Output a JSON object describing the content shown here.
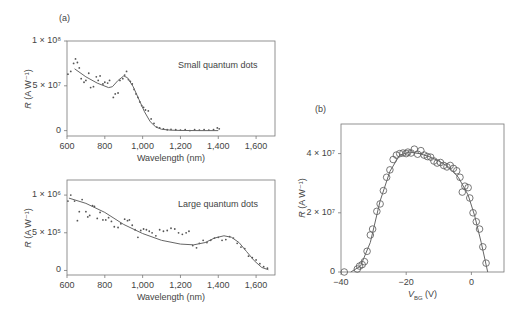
{
  "panels": {
    "a_label": "(a)",
    "b_label": "(b)"
  },
  "chart_data": [
    {
      "id": "small_qd",
      "type": "scatter",
      "panel": "(a)",
      "annotation": "Small quantum dots",
      "xlabel": "Wavelength (nm)",
      "ylabel": "R (A W⁻¹)",
      "xlim": [
        600,
        1700
      ],
      "ylim": [
        -6000000.0,
        100000000.0
      ],
      "xticks": [
        600,
        800,
        1000,
        1200,
        1400,
        1600
      ],
      "xtick_labels": [
        "600",
        "800",
        "1,000",
        "1,200",
        "1,400",
        "1,600"
      ],
      "yticks": [
        0,
        50000000.0,
        100000000.0
      ],
      "ytick_labels": [
        "0",
        "5 × 10⁷",
        "1 × 10⁸"
      ],
      "series": [
        {
          "name": "measured",
          "style": "dots",
          "x": [
            605,
            620,
            635,
            645,
            655,
            665,
            675,
            690,
            700,
            715,
            725,
            740,
            755,
            765,
            775,
            790,
            800,
            815,
            825,
            845,
            855,
            870,
            880,
            895,
            905,
            915,
            925,
            935,
            945,
            955,
            965,
            975,
            985,
            995,
            1005,
            1015,
            1030,
            1045,
            1060,
            1075,
            1090,
            1110,
            1130,
            1150,
            1175,
            1200,
            1225,
            1250,
            1275,
            1300,
            1325,
            1350,
            1375,
            1395,
            1405
          ],
          "y": [
            63000000.0,
            66000000.0,
            75000000.0,
            80000000.0,
            76000000.0,
            70000000.0,
            58000000.0,
            54000000.0,
            56000000.0,
            64000000.0,
            48000000.0,
            49000000.0,
            60000000.0,
            56000000.0,
            61000000.0,
            52000000.0,
            54000000.0,
            53000000.0,
            56000000.0,
            37000000.0,
            41000000.0,
            42000000.0,
            56000000.0,
            58000000.0,
            62000000.0,
            66000000.0,
            57000000.0,
            55000000.0,
            52000000.0,
            46000000.0,
            41000000.0,
            37000000.0,
            32000000.0,
            28000000.0,
            26000000.0,
            23000000.0,
            22000000.0,
            13000000.0,
            8000000.0,
            4000000.0,
            3000000.0,
            2000000.0,
            1000000.0,
            1500000.0,
            1000000.0,
            500000.0,
            1000000.0,
            0.0,
            1000000.0,
            500000.0,
            1000000.0,
            500000.0,
            1000000.0,
            3000000.0,
            2000000.0
          ]
        },
        {
          "name": "fit",
          "style": "line",
          "x": [
            640,
            700,
            760,
            820,
            840,
            870,
            900,
            920,
            950,
            980,
            1010,
            1040,
            1070,
            1100,
            1150,
            1200,
            1300,
            1400
          ],
          "y": [
            69000000.0,
            60000000.0,
            53000000.0,
            48000000.0,
            49000000.0,
            56000000.0,
            61000000.0,
            59000000.0,
            49000000.0,
            35000000.0,
            21000000.0,
            10000000.0,
            4000000.0,
            1500000.0,
            500000.0,
            200000.0,
            0.0,
            0.0
          ]
        }
      ]
    },
    {
      "id": "large_qd",
      "type": "scatter",
      "panel": "(a)",
      "annotation": "Large quantum dots",
      "xlabel": "Wavelength (nm)",
      "ylabel": "R (A W⁻¹)",
      "xlim": [
        600,
        1700
      ],
      "ylim": [
        -60000.0,
        1200000.0
      ],
      "xticks": [
        600,
        800,
        1000,
        1200,
        1400,
        1600
      ],
      "xtick_labels": [
        "600",
        "800",
        "1,000",
        "1,200",
        "1,400",
        "1,600"
      ],
      "yticks": [
        0,
        500000.0,
        1000000.0
      ],
      "ytick_labels": [
        "0",
        "5 × 10⁵",
        "1 × 10⁶"
      ],
      "series": [
        {
          "name": "measured",
          "style": "dots",
          "x": [
            605,
            620,
            640,
            655,
            665,
            680,
            700,
            710,
            720,
            735,
            745,
            760,
            775,
            790,
            805,
            820,
            835,
            850,
            870,
            885,
            905,
            920,
            930,
            945,
            960,
            975,
            990,
            1005,
            1020,
            1035,
            1050,
            1070,
            1090,
            1110,
            1130,
            1150,
            1170,
            1190,
            1210,
            1230,
            1245,
            1265,
            1285,
            1300,
            1320,
            1340,
            1360,
            1380,
            1400,
            1420,
            1440,
            1460,
            1480,
            1500,
            1520,
            1540,
            1560,
            1580,
            1600,
            1620,
            1640,
            1660
          ],
          "y": [
            920000.0,
            1000000.0,
            920000.0,
            660000.0,
            780000.0,
            940000.0,
            780000.0,
            710000.0,
            730000.0,
            860000.0,
            850000.0,
            690000.0,
            770000.0,
            670000.0,
            670000.0,
            700000.0,
            650000.0,
            580000.0,
            570000.0,
            620000.0,
            680000.0,
            660000.0,
            670000.0,
            600000.0,
            540000.0,
            440000.0,
            530000.0,
            550000.0,
            540000.0,
            520000.0,
            500000.0,
            460000.0,
            540000.0,
            520000.0,
            530000.0,
            560000.0,
            550000.0,
            500000.0,
            480000.0,
            500000.0,
            520000.0,
            330000.0,
            300000.0,
            360000.0,
            400000.0,
            370000.0,
            400000.0,
            430000.0,
            440000.0,
            400000.0,
            410000.0,
            450000.0,
            430000.0,
            360000.0,
            310000.0,
            290000.0,
            190000.0,
            170000.0,
            140000.0,
            90000.0,
            50000.0,
            30000.0
          ]
        },
        {
          "name": "fit",
          "style": "line",
          "x": [
            610,
            700,
            800,
            900,
            1000,
            1100,
            1200,
            1270,
            1330,
            1380,
            1430,
            1470,
            1510,
            1550,
            1590,
            1630,
            1665
          ],
          "y": [
            960000.0,
            890000.0,
            770000.0,
            610000.0,
            490000.0,
            400000.0,
            350000.0,
            340000.0,
            370000.0,
            430000.0,
            460000.0,
            440000.0,
            370000.0,
            250000.0,
            130000.0,
            40000.0,
            10000.0
          ]
        }
      ]
    },
    {
      "id": "vbg",
      "type": "scatter",
      "panel": "(b)",
      "xlabel": "V_BG (V)",
      "ylabel": "R (A W⁻¹)",
      "xlim": [
        -40,
        10
      ],
      "ylim": [
        0,
        50000000.0
      ],
      "xticks": [
        -40,
        -20,
        0
      ],
      "xtick_labels": [
        "−40",
        "−20",
        "0"
      ],
      "yticks": [
        0,
        20000000.0,
        40000000.0
      ],
      "ytick_labels": [
        "0",
        "2 × 10⁷",
        "4 × 10⁷"
      ],
      "series": [
        {
          "name": "measured",
          "style": "open-circles",
          "x": [
            -39,
            -35,
            -34.3,
            -33.5,
            -32.8,
            -32,
            -31,
            -30.3,
            -29,
            -28,
            -27,
            -26,
            -25,
            -24,
            -23,
            -22,
            -21,
            -20,
            -19.5,
            -18.5,
            -17.5,
            -16.5,
            -15.5,
            -14.5,
            -13.5,
            -12.5,
            -11.5,
            -10.5,
            -9.5,
            -8.5,
            -7.5,
            -6.5,
            -5.5,
            -4.5,
            -3.5,
            -2.8,
            -2,
            -1,
            -0.5,
            0.5,
            1.5,
            2.5,
            3.5,
            4.5
          ],
          "y": [
            0.0,
            1000000.0,
            2000000.0,
            2500000.0,
            3500000.0,
            7000000.0,
            12500000.0,
            14500000.0,
            20500000.0,
            23000000.0,
            27500000.0,
            32000000.0,
            34500000.0,
            38000000.0,
            39500000.0,
            40000000.0,
            40200000.0,
            40000000.0,
            40500000.0,
            40200000.0,
            41500000.0,
            39800000.0,
            41000000.0,
            39500000.0,
            39000000.0,
            38800000.0,
            37500000.0,
            36800000.0,
            37000000.0,
            36000000.0,
            35500000.0,
            36000000.0,
            35000000.0,
            34200000.0,
            32000000.0,
            27000000.0,
            29000000.0,
            28500000.0,
            25000000.0,
            20000000.0,
            17000000.0,
            14500000.0,
            8500000.0,
            3000000.0
          ]
        },
        {
          "name": "fit",
          "style": "line",
          "x": [
            -37,
            -34,
            -31,
            -28,
            -25,
            -22,
            -19,
            -16,
            -13,
            -10,
            -7,
            -4,
            -1,
            1,
            3,
            5
          ],
          "y": [
            0.0,
            2000000.0,
            10000000.0,
            24000000.0,
            34000000.0,
            39500000.0,
            40500000.0,
            40000000.0,
            39000000.0,
            37500000.0,
            35500000.0,
            32000000.0,
            26000000.0,
            19000000.0,
            10000000.0,
            0.0
          ]
        }
      ]
    }
  ]
}
